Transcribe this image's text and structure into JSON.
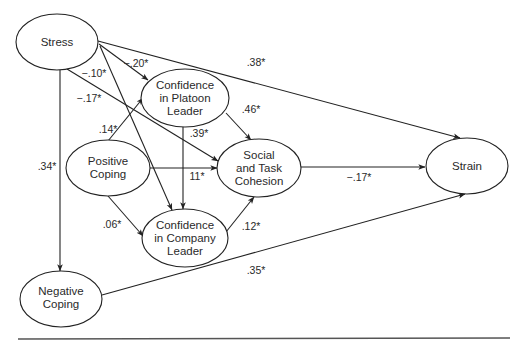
{
  "diagram": {
    "type": "path-model",
    "nodes": {
      "stress": {
        "lines": [
          "Stress"
        ],
        "cx": 57,
        "cy": 42,
        "rx": 41,
        "ry": 28
      },
      "platoon": {
        "lines": [
          "Confidence",
          "in Platoon",
          "Leader"
        ],
        "cx": 185,
        "cy": 98,
        "rx": 44,
        "ry": 29
      },
      "positive": {
        "lines": [
          "Positive",
          "Coping"
        ],
        "cx": 108,
        "cy": 168,
        "rx": 42,
        "ry": 28
      },
      "social": {
        "lines": [
          "Social",
          "and Task",
          "Cohesion"
        ],
        "cx": 259,
        "cy": 168,
        "rx": 42,
        "ry": 29
      },
      "company": {
        "lines": [
          "Confidence",
          "in Company",
          "Leader"
        ],
        "cx": 185,
        "cy": 238,
        "rx": 43,
        "ry": 29
      },
      "strain": {
        "lines": [
          "Strain"
        ],
        "cx": 467,
        "cy": 166,
        "rx": 41,
        "ry": 28
      },
      "negative": {
        "lines": [
          "Negative",
          "Coping"
        ],
        "cx": 61,
        "cy": 299,
        "rx": 41,
        "ry": 28
      }
    },
    "edges": [
      {
        "id": "stress-platoon",
        "from": "Stress",
        "to": "Confidence in Platoon Leader",
        "label": "−.20*"
      },
      {
        "id": "stress-strain",
        "from": "Stress",
        "to": "Strain",
        "label": ".38*"
      },
      {
        "id": "stress-company",
        "from": "Stress",
        "to": "Confidence in Company Leader",
        "label": "−.10*"
      },
      {
        "id": "stress-social",
        "from": "Stress",
        "to": "Social and Task Cohesion",
        "label": "−.17*"
      },
      {
        "id": "stress-negative",
        "from": "Stress",
        "to": "Negative Coping",
        "label": ".34*"
      },
      {
        "id": "positive-platoon",
        "from": "Positive Coping",
        "to": "Confidence in Platoon Leader",
        "label": ".14*"
      },
      {
        "id": "positive-social",
        "from": "Positive Coping",
        "to": "Social and Task Cohesion",
        "label": "11*"
      },
      {
        "id": "positive-company",
        "from": "Positive Coping",
        "to": "Confidence in Company Leader",
        "label": ".06*"
      },
      {
        "id": "platoon-social",
        "from": "Confidence in Platoon Leader",
        "to": "Social and Task Cohesion",
        "label": ".46*"
      },
      {
        "id": "platoon-company",
        "from": "Confidence in Platoon Leader",
        "to": "Confidence in Company Leader",
        "label": ".39*"
      },
      {
        "id": "company-social",
        "from": "Confidence in Company Leader",
        "to": "Social and Task Cohesion",
        "label": ".12*"
      },
      {
        "id": "social-strain",
        "from": "Social and Task Cohesion",
        "to": "Strain",
        "label": "−.17*"
      },
      {
        "id": "negative-strain",
        "from": "Negative Coping",
        "to": "Strain",
        "label": ".35*"
      }
    ],
    "labels": {
      "stress_platoon": "−.20*",
      "stress_strain": ".38*",
      "stress_company": "−.10*",
      "stress_social": "−.17*",
      "stress_negative": ".34*",
      "positive_platoon": ".14*",
      "positive_social": "11*",
      "positive_company": ".06*",
      "platoon_social": ".46*",
      "platoon_company": ".39*",
      "company_social": ".12*",
      "social_strain": "−.17*",
      "negative_strain": ".35*"
    },
    "colors": {
      "stroke": "#222222",
      "text": "#2a2a2a",
      "background": "#ffffff",
      "rule": "#555555"
    }
  }
}
